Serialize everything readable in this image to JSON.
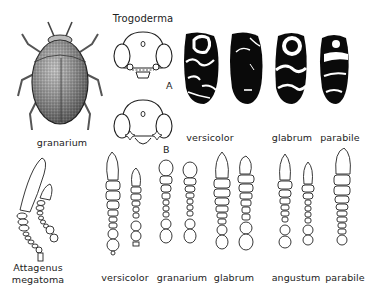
{
  "plate": {
    "title": "Trogoderma",
    "beetle": {
      "label": "granarium"
    },
    "heads": [
      {
        "id": "A",
        "label": "A"
      },
      {
        "id": "B",
        "label": "B"
      }
    ],
    "elytra": [
      {
        "species": "versicolor",
        "label": "versicolor"
      },
      {
        "species": "versicolor_2",
        "label": ""
      },
      {
        "species": "glabrum",
        "label": "glabrum"
      },
      {
        "species": "parabile",
        "label": "parabile"
      }
    ],
    "elytra_labels": [
      "versicolor",
      "glabrum",
      "parabile"
    ],
    "antennae": {
      "attagenus": {
        "label_line1": "Attagenus",
        "label_line2": "megatoma"
      },
      "labels": [
        "versicolor",
        "granarium",
        "glabrum",
        "angustum",
        "parabile"
      ]
    },
    "colors": {
      "ink": "#111111",
      "paper": "#ffffff"
    }
  }
}
